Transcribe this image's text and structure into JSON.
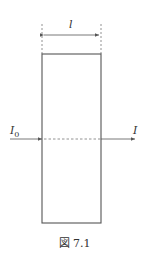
{
  "figure": {
    "caption": "図 7.1",
    "width_label": "l",
    "incident_label": "I",
    "incident_subscript": "0",
    "transmitted_label": "I"
  },
  "colors": {
    "line": "#555555",
    "text": "#333333"
  }
}
